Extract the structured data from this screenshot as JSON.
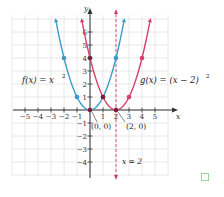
{
  "chart_data": {
    "type": "line",
    "title": "",
    "xlabel": "x",
    "ylabel": "y",
    "xlim": [
      -6,
      6
    ],
    "ylim": [
      -5,
      7
    ],
    "grid": true,
    "x_ticks": [
      -5,
      -4,
      -3,
      -2,
      -1,
      1,
      2,
      3,
      4,
      5
    ],
    "y_ticks": [
      -4,
      -3,
      -2,
      -1,
      1,
      2,
      3,
      4,
      5,
      6
    ],
    "series": [
      {
        "name": "f(x) = x^2",
        "label": "f(x) = x",
        "label_sup": "2",
        "color": "#3a9cc6",
        "points": [
          [
            -2,
            4
          ],
          [
            -1,
            1
          ],
          [
            0,
            0
          ],
          [
            1,
            1
          ],
          [
            2,
            4
          ]
        ]
      },
      {
        "name": "g(x) = (x − 2)^2",
        "label": "g(x) = (x − 2)",
        "label_sup": "2",
        "color": "#d2416b",
        "points": [
          [
            0,
            4
          ],
          [
            1,
            1
          ],
          [
            2,
            0
          ],
          [
            3,
            1
          ],
          [
            4,
            4
          ]
        ]
      }
    ],
    "annotations": [
      {
        "text": "(0, 0)",
        "x": 0,
        "y": 0
      },
      {
        "text": "(2, 0)",
        "x": 2,
        "y": 0
      },
      {
        "text": "x = 2",
        "type": "vertical-dashed-line",
        "x": 2,
        "color": "#d2416b"
      }
    ]
  },
  "checkbox": {
    "checked": false,
    "border_color": "#9fd29a"
  }
}
